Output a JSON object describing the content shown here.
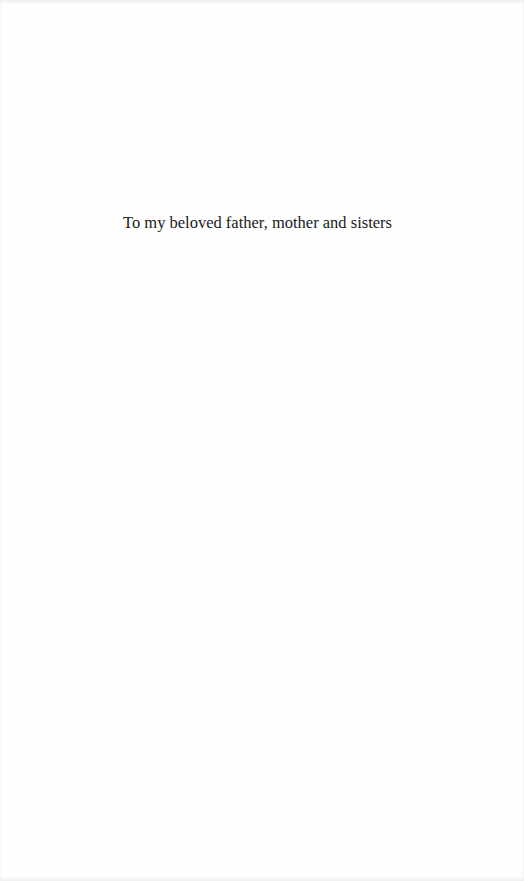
{
  "page": {
    "dedication": "To my beloved father, mother and sisters"
  }
}
